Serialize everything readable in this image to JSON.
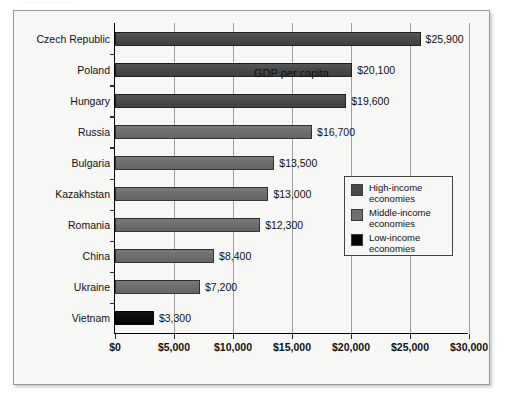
{
  "top_remnant": "......................",
  "chart_data": {
    "type": "bar",
    "orientation": "horizontal",
    "title": "",
    "xlabel": "GDP per capita",
    "ylabel": "",
    "xlim": [
      0,
      30000
    ],
    "xticks": [
      0,
      5000,
      10000,
      15000,
      20000,
      25000,
      30000
    ],
    "xtick_labels": [
      "$0",
      "$5,000",
      "$10,000",
      "$15,000",
      "$20,000",
      "$25,000",
      "$30,000"
    ],
    "grid": "vertical",
    "legend_position": "center-right",
    "categories": [
      "Czech Republic",
      "Poland",
      "Hungary",
      "Russia",
      "Bulgaria",
      "Kazakhstan",
      "Romania",
      "China",
      "Ukraine",
      "Vietnam"
    ],
    "values": [
      25900,
      20100,
      19600,
      16700,
      13500,
      13000,
      12300,
      8400,
      7200,
      3300
    ],
    "value_labels": [
      "$25,900",
      "$20,100",
      "$19,600",
      "$16,700",
      "$13,500",
      "$13,000",
      "$12,300",
      "$8,400",
      "$7,200",
      "$3,300"
    ],
    "groups": [
      "high",
      "high",
      "high",
      "middle",
      "middle",
      "middle",
      "middle",
      "middle",
      "middle",
      "low"
    ],
    "legend": [
      {
        "key": "high",
        "label_line1": "High-income",
        "label_line2": "economies",
        "color": "#4a4a4a"
      },
      {
        "key": "middle",
        "label_line1": "Middle-income",
        "label_line2": "economies",
        "color": "#6e6e6e"
      },
      {
        "key": "low",
        "label_line1": "Low-income",
        "label_line2": "economies",
        "color": "#060606"
      }
    ],
    "colors": {
      "high": "#4a4a4a",
      "middle": "#6e6e6e",
      "low": "#060606",
      "grid": "#9d9d9d",
      "axis": "#000000",
      "background": "#f7f7f5"
    }
  }
}
